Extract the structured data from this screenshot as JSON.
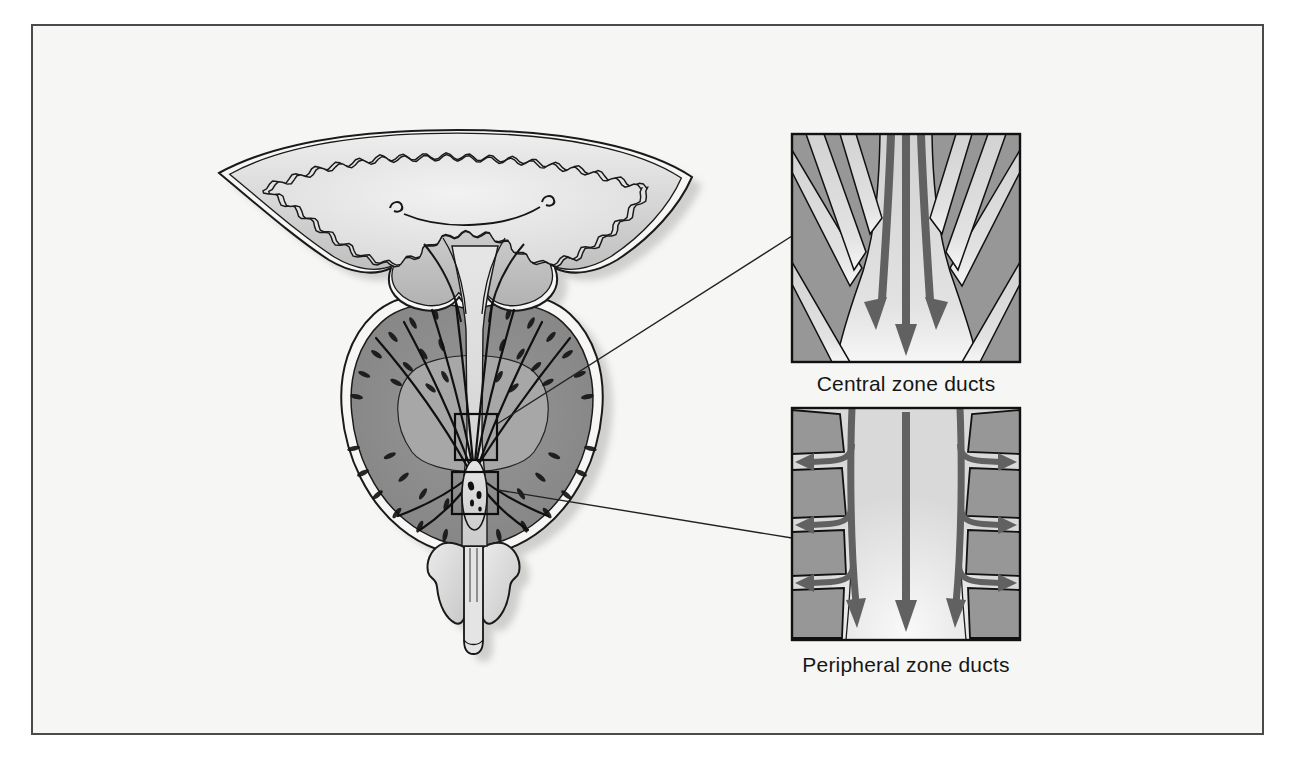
{
  "insets": [
    {
      "id": "central-zone-ducts",
      "label": "Central zone ducts"
    },
    {
      "id": "peripheral-zone-ducts",
      "label": "Peripheral zone ducts"
    }
  ],
  "colors": {
    "page_bg": "#ffffff",
    "panel_bg": "#f6f6f4",
    "frame_border": "#4a4a4a",
    "outline": "#1a1a1a",
    "white_band": "#f7f6f4",
    "bladder_wall_light": "#ededed",
    "bladder_wall_dark": "#b4b4b4",
    "lumen_light": "#f1f1f1",
    "lumen_dark": "#dcdcdc",
    "prostate_peripheral": "#8f8f8f",
    "prostate_peripheral_edge": "#828282",
    "prostate_central": "#a7a7a7",
    "duct_dash": "#151515",
    "urethra_light": "#e0e0e0",
    "wings_fill": "#dedede",
    "inset_gray": "#979797",
    "inset_channel": "#d9d9d9",
    "inset_channel_bright": "#f5f5f5",
    "arrow": "#616161",
    "callout_line": "#222222",
    "shadow": "#a0a0a0",
    "label_text": "#161616"
  }
}
